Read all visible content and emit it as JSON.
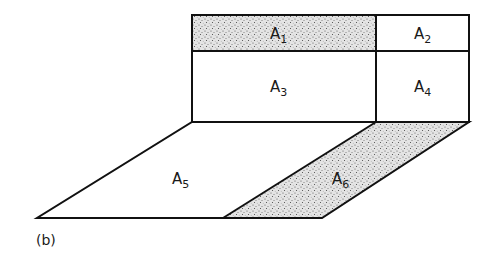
{
  "figure": {
    "label": "(b)",
    "stroke_color": "#111111",
    "shade_color": "#c8c8c8",
    "background": "#ffffff"
  },
  "regions": [
    {
      "id": "A1",
      "letter": "A",
      "index": "1",
      "shaded": true
    },
    {
      "id": "A2",
      "letter": "A",
      "index": "2",
      "shaded": false
    },
    {
      "id": "A3",
      "letter": "A",
      "index": "3",
      "shaded": false
    },
    {
      "id": "A4",
      "letter": "A",
      "index": "4",
      "shaded": false
    },
    {
      "id": "A5",
      "letter": "A",
      "index": "5",
      "shaded": false
    },
    {
      "id": "A6",
      "letter": "A",
      "index": "6",
      "shaded": true
    }
  ]
}
